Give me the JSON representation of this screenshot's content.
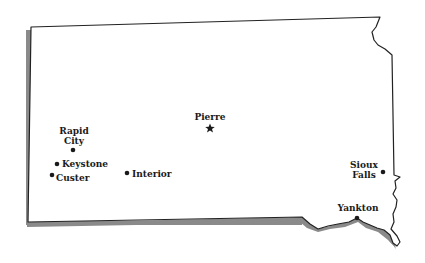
{
  "map": {
    "region": "South Dakota",
    "colors": {
      "outline": "#222222",
      "shadow": "#8a8a8a",
      "fill": "#ffffff",
      "marker": "#1a1a1a"
    },
    "capital": {
      "name": "Pierre",
      "marker": "star-icon",
      "x": 210,
      "y": 128
    },
    "cities": [
      {
        "id": "rapid-city",
        "line1": "Rapid",
        "line2": "City",
        "marker": "dot",
        "x": 73,
        "y": 150
      },
      {
        "id": "keystone",
        "line1": "Keystone",
        "marker": "dot",
        "x": 57,
        "y": 164
      },
      {
        "id": "custer",
        "line1": "Custer",
        "marker": "dot",
        "x": 52,
        "y": 175
      },
      {
        "id": "interior",
        "line1": "Interior",
        "marker": "dot",
        "x": 127,
        "y": 173
      },
      {
        "id": "sioux-falls",
        "line1": "Sioux",
        "line2": "Falls",
        "marker": "dot",
        "x": 383,
        "y": 172
      },
      {
        "id": "yankton",
        "line1": "Yankton",
        "marker": "dot",
        "x": 357,
        "y": 218
      }
    ]
  }
}
